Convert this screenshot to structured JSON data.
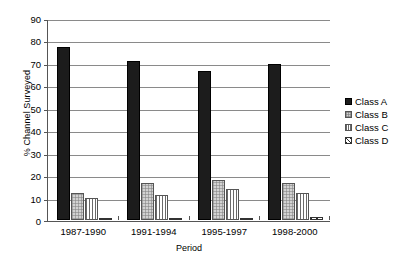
{
  "chart_data": {
    "type": "bar",
    "title": "",
    "subtitle": "",
    "xlabel": "Period",
    "ylabel": "% Channel Surveyed",
    "categories": [
      "1987-1990",
      "1991-1994",
      "1995-1997",
      "1998-2000"
    ],
    "series": [
      {
        "name": "Class A",
        "values": [
          77.5,
          71,
          66.5,
          70
        ],
        "color": "#1c1c1c",
        "pattern": "solid-black"
      },
      {
        "name": "Class B",
        "values": [
          12,
          16.5,
          18,
          16.5
        ],
        "color": "#d2d2d2",
        "pattern": "fine-dotted-grey"
      },
      {
        "name": "Class C",
        "values": [
          9.8,
          11,
          14,
          12
        ],
        "color": "#ffffff",
        "pattern": "vertical-lines"
      },
      {
        "name": "Class D",
        "values": [
          1,
          1,
          1,
          1.5
        ],
        "color": "#ffffff",
        "pattern": "diagonal-hatch"
      }
    ],
    "ylim": [
      0,
      90
    ],
    "yticks": [
      0,
      10,
      20,
      30,
      40,
      50,
      60,
      70,
      80,
      90
    ],
    "ytick_labels": [
      "0",
      "10",
      "20",
      "30",
      "40",
      "50",
      "60",
      "70",
      "80",
      "90"
    ],
    "grid": true,
    "grid_axis": "y",
    "legend_position": "right",
    "legend": [
      "Class A",
      "Class B",
      "Class C",
      "Class D"
    ]
  }
}
